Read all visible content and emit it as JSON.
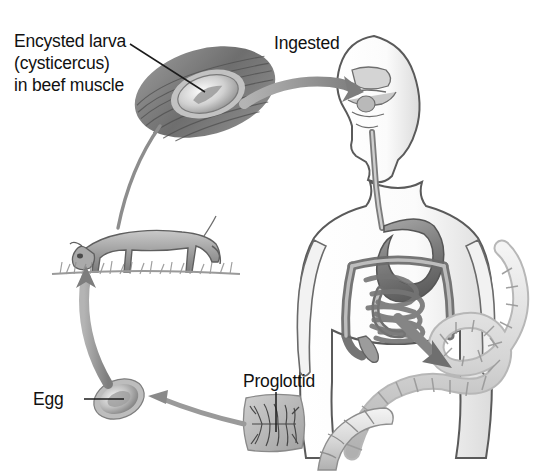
{
  "diagram": {
    "type": "life-cycle",
    "background_color": "#ffffff",
    "style": "grayscale pencil/airbrush medical illustration",
    "label_color": "#111111"
  },
  "labels": {
    "cysticercus": "Encysted larva\n(cysticercus)\nin beef muscle",
    "ingested": "Ingested",
    "egg": "Egg",
    "proglottid": "Proglottid"
  },
  "stages": [
    {
      "id": "beef-muscle",
      "name": "Encysted larva (cysticercus) in beef muscle",
      "description": "Pale oval cyst embedded in striated beef muscle fibers",
      "label_ref": "cysticercus"
    },
    {
      "id": "human-host",
      "name": "Human definitive host",
      "description": "Human torso in profile showing mouth, pharynx, esophagus, stomach and intestines",
      "label_ref": "ingested"
    },
    {
      "id": "adult-tapeworm",
      "name": "Adult segmented tapeworm",
      "description": "Long ribbon of proglottid segments emerging from the intestine"
    },
    {
      "id": "proglottid",
      "name": "Gravid proglottid",
      "description": "Detached rectangular segment with dark branching egg-filled uterus",
      "label_ref": "proglottid"
    },
    {
      "id": "egg",
      "name": "Egg",
      "description": "Oval thick-shelled egg shed onto pasture",
      "label_ref": "egg"
    },
    {
      "id": "cow",
      "name": "Grazing cow (intermediate host)",
      "description": "Cow grazing on grass, ingesting eggs from pasture"
    }
  ],
  "arrows": [
    {
      "id": "beef-to-human",
      "from": "beef-muscle",
      "to": "human-host",
      "label_ref": "ingested",
      "style": "thick-gray-curved"
    },
    {
      "id": "intestine-to-worm",
      "from": "human-host",
      "to": "adult-tapeworm",
      "style": "thick-gray-straight"
    },
    {
      "id": "worm-to-proglottid",
      "from": "adult-tapeworm",
      "to": "proglottid",
      "style": "thin-gray"
    },
    {
      "id": "proglottid-to-egg",
      "from": "proglottid",
      "to": "egg",
      "style": "thin-gray-curved"
    },
    {
      "id": "egg-to-cow",
      "from": "egg",
      "to": "cow",
      "style": "thick-gray-curved"
    },
    {
      "id": "cow-to-beef",
      "from": "cow",
      "to": "beef-muscle",
      "style": "thin-leader-line"
    }
  ],
  "leader_lines": [
    {
      "id": "cysticercus-leader",
      "from_label": "cysticercus",
      "to_stage": "beef-muscle"
    },
    {
      "id": "egg-leader",
      "from_label": "egg",
      "to_stage": "egg"
    },
    {
      "id": "proglottid-leader",
      "from_label": "proglottid",
      "to_stage": "proglottid"
    }
  ],
  "colors": {
    "ink": "#111111",
    "arrow_gray": "#8e8e8e",
    "arrow_gray_dark": "#6f6f6f",
    "tissue_light": "#d8d8d8",
    "tissue_mid": "#a8a8a8",
    "tissue_dark": "#6a6a6a",
    "outline": "#4a4a4a"
  }
}
